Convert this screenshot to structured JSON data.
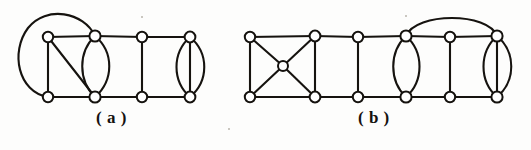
{
  "figure": {
    "width": 531,
    "height": 150,
    "background_color": "#fdfdfc",
    "ink_color": "#16130f",
    "node_fill_color": "#ffffff"
  },
  "captions": {
    "a": "( a )",
    "b": "( b )"
  },
  "graphs": [
    {
      "id": "graph-a",
      "label": "( a )",
      "node_count": 8,
      "nodes": [
        {
          "id": "a-t1",
          "x": 48,
          "y": 37,
          "r": 5.2
        },
        {
          "id": "a-t2",
          "x": 95,
          "y": 36,
          "r": 5.6
        },
        {
          "id": "a-t3",
          "x": 142,
          "y": 37,
          "r": 5.2
        },
        {
          "id": "a-t4",
          "x": 190,
          "y": 37,
          "r": 5.4
        },
        {
          "id": "a-b1",
          "x": 48,
          "y": 97,
          "r": 5.2
        },
        {
          "id": "a-b2",
          "x": 95,
          "y": 97,
          "r": 5.6
        },
        {
          "id": "a-b3",
          "x": 142,
          "y": 97,
          "r": 5.2
        },
        {
          "id": "a-b4",
          "x": 190,
          "y": 97,
          "r": 5.4
        }
      ],
      "edges": [
        {
          "from": "a-t1",
          "to": "a-t2",
          "kind": "straight"
        },
        {
          "from": "a-t2",
          "to": "a-t3",
          "kind": "straight"
        },
        {
          "from": "a-t3",
          "to": "a-t4",
          "kind": "straight"
        },
        {
          "from": "a-b1",
          "to": "a-b2",
          "kind": "straight"
        },
        {
          "from": "a-b2",
          "to": "a-b3",
          "kind": "straight"
        },
        {
          "from": "a-b3",
          "to": "a-b4",
          "kind": "straight"
        },
        {
          "from": "a-t1",
          "to": "a-b1",
          "kind": "straight"
        },
        {
          "from": "a-t3",
          "to": "a-b3",
          "kind": "straight"
        },
        {
          "from": "a-t1",
          "to": "a-b2",
          "kind": "diagonal"
        },
        {
          "from": "a-b1",
          "to": "a-t2",
          "kind": "big-outer-arc"
        },
        {
          "from": "a-t2",
          "to": "a-b2",
          "kind": "lens-left"
        },
        {
          "from": "a-t2",
          "to": "a-b2",
          "kind": "lens-right"
        },
        {
          "from": "a-t4",
          "to": "a-b4",
          "kind": "lens-left"
        },
        {
          "from": "a-t4",
          "to": "a-b4",
          "kind": "straight"
        },
        {
          "from": "a-t4",
          "to": "a-b4",
          "kind": "lens-right"
        }
      ]
    },
    {
      "id": "graph-b",
      "label": "( b )",
      "node_count": 13,
      "nodes": [
        {
          "id": "b-t1",
          "x": 250,
          "y": 37,
          "r": 5.2
        },
        {
          "id": "b-t2",
          "x": 315,
          "y": 36,
          "r": 5.4
        },
        {
          "id": "b-t3",
          "x": 358,
          "y": 37,
          "r": 5.2
        },
        {
          "id": "b-t4",
          "x": 406,
          "y": 36,
          "r": 5.6
        },
        {
          "id": "b-t5",
          "x": 450,
          "y": 37,
          "r": 5.2
        },
        {
          "id": "b-t6",
          "x": 497,
          "y": 36,
          "r": 5.6
        },
        {
          "id": "b-b1",
          "x": 250,
          "y": 97,
          "r": 5.2
        },
        {
          "id": "b-b2",
          "x": 315,
          "y": 97,
          "r": 5.4
        },
        {
          "id": "b-b3",
          "x": 358,
          "y": 97,
          "r": 5.2
        },
        {
          "id": "b-b4",
          "x": 406,
          "y": 97,
          "r": 5.6
        },
        {
          "id": "b-b5",
          "x": 450,
          "y": 97,
          "r": 5.2
        },
        {
          "id": "b-b6",
          "x": 497,
          "y": 97,
          "r": 5.6
        },
        {
          "id": "b-c",
          "x": 283,
          "y": 66,
          "r": 5.0
        }
      ],
      "edges": [
        {
          "from": "b-t1",
          "to": "b-t2",
          "kind": "straight"
        },
        {
          "from": "b-t2",
          "to": "b-t3",
          "kind": "straight"
        },
        {
          "from": "b-t3",
          "to": "b-t4",
          "kind": "straight"
        },
        {
          "from": "b-t4",
          "to": "b-t5",
          "kind": "straight"
        },
        {
          "from": "b-t5",
          "to": "b-t6",
          "kind": "straight"
        },
        {
          "from": "b-b1",
          "to": "b-b2",
          "kind": "straight"
        },
        {
          "from": "b-b2",
          "to": "b-b3",
          "kind": "straight"
        },
        {
          "from": "b-b3",
          "to": "b-b4",
          "kind": "straight"
        },
        {
          "from": "b-b4",
          "to": "b-b5",
          "kind": "straight"
        },
        {
          "from": "b-b5",
          "to": "b-b6",
          "kind": "straight"
        },
        {
          "from": "b-t1",
          "to": "b-b1",
          "kind": "straight"
        },
        {
          "from": "b-t2",
          "to": "b-b2",
          "kind": "straight"
        },
        {
          "from": "b-t3",
          "to": "b-b3",
          "kind": "straight"
        },
        {
          "from": "b-t5",
          "to": "b-b5",
          "kind": "straight"
        },
        {
          "from": "b-t1",
          "to": "b-c",
          "kind": "cross"
        },
        {
          "from": "b-t2",
          "to": "b-c",
          "kind": "cross"
        },
        {
          "from": "b-b1",
          "to": "b-c",
          "kind": "cross"
        },
        {
          "from": "b-b2",
          "to": "b-c",
          "kind": "cross"
        },
        {
          "from": "b-t4",
          "to": "b-t6",
          "kind": "top-arc"
        },
        {
          "from": "b-t4",
          "to": "b-b4",
          "kind": "lens-left"
        },
        {
          "from": "b-t4",
          "to": "b-b4",
          "kind": "lens-right"
        },
        {
          "from": "b-t6",
          "to": "b-b6",
          "kind": "lens-left"
        },
        {
          "from": "b-t6",
          "to": "b-b6",
          "kind": "straight"
        },
        {
          "from": "b-t6",
          "to": "b-b6",
          "kind": "lens-right"
        }
      ]
    }
  ],
  "specks": [
    {
      "x": 141,
      "y": 16,
      "size": 2
    },
    {
      "x": 405,
      "y": 15,
      "size": 2
    },
    {
      "x": 228,
      "y": 128,
      "size": 2
    }
  ]
}
